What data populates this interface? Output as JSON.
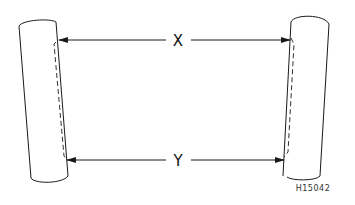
{
  "diagram": {
    "title": "",
    "dimensions": [
      {
        "id": "x",
        "label": "X",
        "description": "distance between upper edges of the two tubes"
      },
      {
        "id": "y",
        "label": "Y",
        "description": "distance between lower edges of the two tubes"
      }
    ],
    "reference_code": "H15042",
    "colors": {
      "line": "#1a1a1a",
      "background": "#ffffff"
    }
  }
}
